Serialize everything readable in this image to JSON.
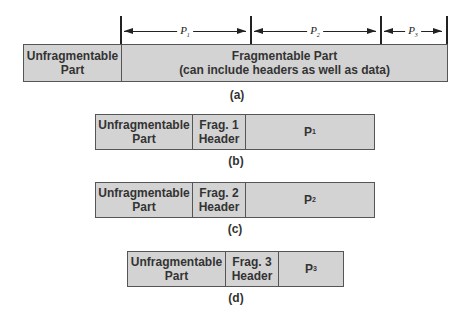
{
  "diagram_a": {
    "dimension_labels": [
      {
        "label": "P",
        "sub": "1"
      },
      {
        "label": "P",
        "sub": "2"
      },
      {
        "label": "P",
        "sub": "3"
      }
    ],
    "unfragmentable": "Unfragmentable Part",
    "unfragmentable_line1": "Unfragmentable",
    "unfragmentable_line2": "Part",
    "fragmentable_line1": "Fragmentable Part",
    "fragmentable_line2": "(can include headers as well as data)",
    "caption": "(a)"
  },
  "fragments": [
    {
      "unfrag_line1": "Unfragmentable",
      "unfrag_line2": "Part",
      "header_line1": "Frag. 1",
      "header_line2": "Header",
      "payload": "P",
      "payload_sub": "1",
      "caption": "(b)"
    },
    {
      "unfrag_line1": "Unfragmentable",
      "unfrag_line2": "Part",
      "header_line1": "Frag. 2",
      "header_line2": "Header",
      "payload": "P",
      "payload_sub": "2",
      "caption": "(c)"
    },
    {
      "unfrag_line1": "Unfragmentable",
      "unfrag_line2": "Part",
      "header_line1": "Frag. 3",
      "header_line2": "Header",
      "payload": "P",
      "payload_sub": "3",
      "caption": "(d)"
    }
  ],
  "colors": {
    "box_fill": "#d3d3d3",
    "border": "#555555",
    "text": "#333333"
  }
}
